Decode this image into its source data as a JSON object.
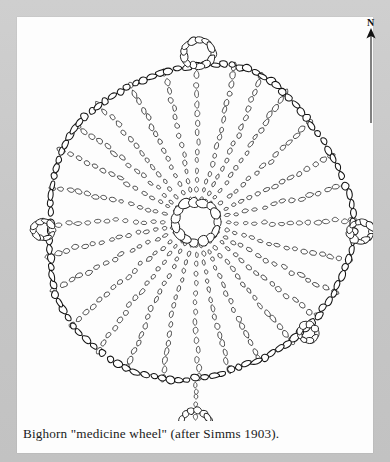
{
  "page": {
    "background_color": "#c9c9c9",
    "paper_color": "#fdfdfd",
    "ink_color": "#1c1c1c"
  },
  "caption": {
    "text": "Bighorn \"medicine wheel\" (after Simms 1903)."
  },
  "north_indicator": {
    "label": "N",
    "icon": "north-arrow-icon",
    "direction": "up"
  },
  "figure": {
    "type": "archaeological-site-plan",
    "medium": "line drawing of stone outlines",
    "center": {
      "x": 196,
      "y": 222
    },
    "rim_radius_x": 152,
    "rim_radius_y": 158,
    "spoke_count": 28,
    "elements": [
      {
        "name": "central-cairn",
        "label": "central cairn"
      },
      {
        "name": "outer-rim",
        "label": "stone rim"
      },
      {
        "name": "spokes",
        "label": "radiating spoke lines"
      },
      {
        "name": "north-cairn",
        "label": "north cairn loop"
      },
      {
        "name": "east-cairn",
        "label": "east rim cairn"
      },
      {
        "name": "west-cairn",
        "label": "west rim cairn"
      },
      {
        "name": "southeast-cairn",
        "label": "southeast rim cairn"
      },
      {
        "name": "detached-south-cairn",
        "label": "detached south cairn ring"
      }
    ]
  },
  "chart_data": {
    "type": "scatter",
    "xlabel": "",
    "ylabel": ""
  }
}
